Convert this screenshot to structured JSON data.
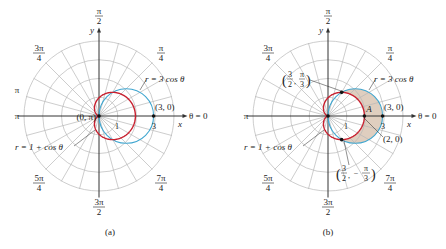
{
  "figures": [
    {
      "id": "a",
      "caption": "(a)",
      "pole": [
        99,
        116
      ],
      "unit_px": 18.2,
      "rings": 4,
      "curves": [
        {
          "name": "cardioid",
          "equation": "r = 1 + cos θ",
          "color": "#c8202f"
        },
        {
          "name": "circle",
          "equation": "r = 3 cos θ",
          "color": "#3fa6d0"
        }
      ],
      "angle_labels": {
        "zero": "θ = 0",
        "pi_over_2_num": "π",
        "pi_over_2_den": "2",
        "pi_over_4_num": "π",
        "pi_over_4_den": "4",
        "three_pi_over_4_num": "3π",
        "three_pi_over_4_den": "4",
        "pi": "π",
        "pi_upper": "π",
        "five_pi_over_4_num": "5π",
        "five_pi_over_4_den": "4",
        "three_pi_over_2_num": "3π",
        "three_pi_over_2_den": "2",
        "seven_pi_over_4_num": "7π",
        "seven_pi_over_4_den": "4"
      },
      "axis_labels": {
        "x": "x",
        "y": "y"
      },
      "tick_labels": {
        "one": "1",
        "three": "3"
      },
      "point_labels": {
        "pole": "(0, π)",
        "three_zero": "(3, 0)"
      },
      "curve_labels": {
        "circle": "r = 3 cos θ",
        "cardioid": "r = 1 + cos θ"
      }
    },
    {
      "id": "b",
      "caption": "(b)",
      "pole": [
        328,
        116
      ],
      "unit_px": 18.2,
      "rings": 4,
      "shaded_region": {
        "label": "A",
        "color": "#d9c6b4"
      },
      "angle_labels": {
        "zero": "θ = 0",
        "pi_over_2_num": "π",
        "pi_over_2_den": "2",
        "pi_over_4_num": "π",
        "pi_over_4_den": "4",
        "three_pi_over_4_num": "3π",
        "three_pi_over_4_den": "4",
        "pi": "π",
        "five_pi_over_4_num": "5π",
        "five_pi_over_4_den": "4",
        "three_pi_over_2_num": "3π",
        "three_pi_over_2_den": "2",
        "seven_pi_over_4_num": "7π",
        "seven_pi_over_4_den": "4"
      },
      "axis_labels": {
        "x": "x",
        "y": "y"
      },
      "tick_labels": {
        "one": "1",
        "three": "3"
      },
      "point_labels": {
        "three_zero": "(3, 0)",
        "two_zero": "(2, 0)",
        "upper_num": "3",
        "upper_den": "2",
        "upper_ang_num": "π",
        "upper_ang_den": "3",
        "lower_num": "3",
        "lower_den": "2",
        "lower_ang_num": "π",
        "lower_ang_den": "3",
        "lower_sign": "−"
      },
      "curve_labels": {
        "circle": "r = 3 cos θ",
        "cardioid": "r = 1 + cos θ"
      }
    }
  ]
}
